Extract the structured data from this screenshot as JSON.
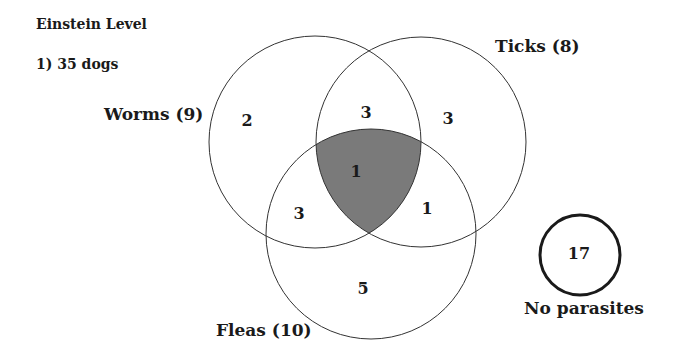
{
  "title": "Einstein Level",
  "problem": "1) 35 dogs",
  "sets": {
    "worms": {
      "label": "Worms (9)",
      "only": "2"
    },
    "ticks": {
      "label": "Ticks (8)",
      "only": "3"
    },
    "fleas": {
      "label": "Fleas (10)",
      "only": "5"
    }
  },
  "intersections": {
    "worms_ticks": "3",
    "worms_fleas": "3",
    "ticks_fleas": "1",
    "all_three": "1"
  },
  "outside": {
    "label": "No parasites",
    "value": "17"
  },
  "colors": {
    "line": "#333333",
    "highlight": "#7a7a7a",
    "background": "#ffffff"
  }
}
